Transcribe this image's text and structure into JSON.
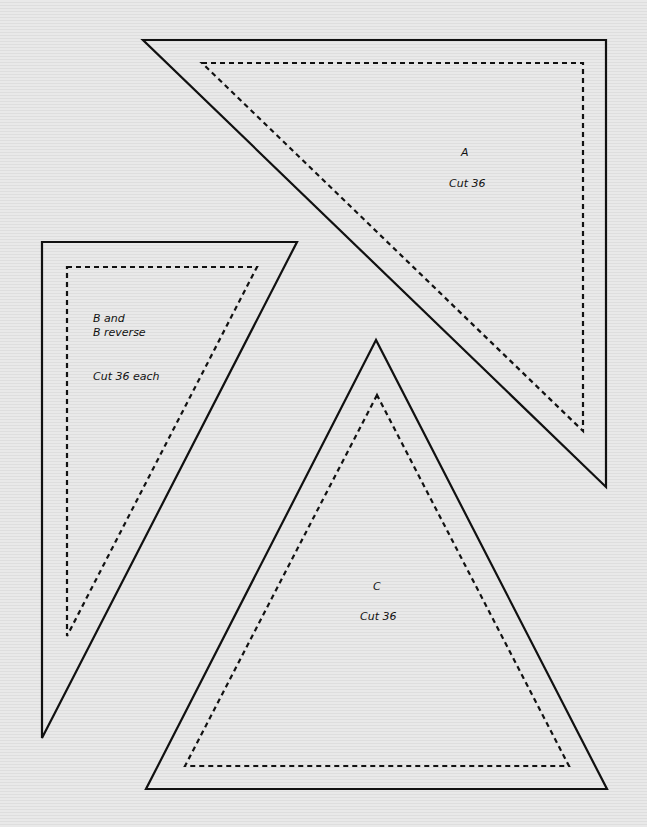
{
  "pieces": {
    "a": {
      "letter": "A",
      "cut": "Cut 36",
      "outer": "143,40 606,40 606,487",
      "inner": "202,63 583,63 583,431"
    },
    "b": {
      "line1": "B and",
      "line2": "B reverse",
      "cut": "Cut 36 each",
      "outer": "42,242 297,242 42,738",
      "inner": "67,267 257,267 67,636"
    },
    "c": {
      "letter": "C",
      "cut": "Cut 36",
      "outer": "376,340 146,789 607,789",
      "inner": "377,395 185,766 569,766"
    }
  },
  "colors": {
    "line": "#111111",
    "background": "#e6e6e6"
  }
}
